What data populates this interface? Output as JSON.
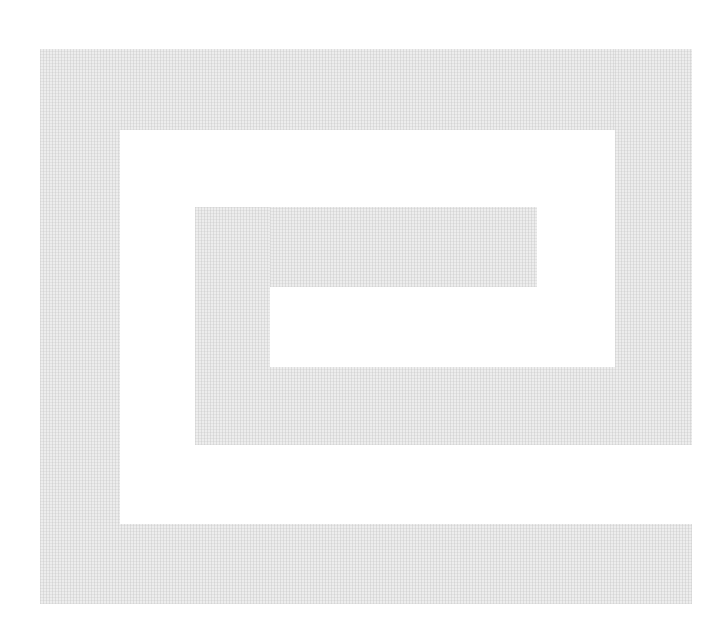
{
  "image": {
    "description": "Gray halftone-textured spiral / 'e'-shaped geometric logo mark on white background",
    "background_color": "#ffffff",
    "mark_color": "#ededed",
    "texture": "crosshatch-halftone"
  },
  "logo": {
    "name": "spiral-e-mark",
    "segments": [
      {
        "id": "outer-top",
        "x": 40,
        "y": 49,
        "w": 652,
        "h": 81
      },
      {
        "id": "outer-left",
        "x": 40,
        "y": 49,
        "w": 80,
        "h": 555
      },
      {
        "id": "outer-bottom",
        "x": 40,
        "y": 524,
        "w": 652,
        "h": 80
      },
      {
        "id": "outer-right",
        "x": 615,
        "y": 49,
        "w": 77,
        "h": 396
      },
      {
        "id": "inner-top",
        "x": 195,
        "y": 207,
        "w": 342,
        "h": 80
      },
      {
        "id": "inner-left",
        "x": 195,
        "y": 207,
        "w": 75,
        "h": 238
      },
      {
        "id": "inner-bottom",
        "x": 195,
        "y": 367,
        "w": 497,
        "h": 78
      }
    ]
  }
}
